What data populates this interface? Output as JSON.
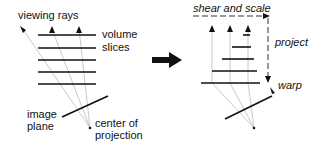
{
  "left_panel": {
    "labels": {
      "viewing_rays": "viewing rays",
      "volume": "volume",
      "slices": "slices",
      "image": "image",
      "plane": "plane",
      "center_of": "center of",
      "projection": "projection"
    }
  },
  "right_panel": {
    "labels": {
      "shear_and_scale": "shear and scale",
      "project": "project",
      "warp": "warp"
    }
  },
  "colors": {
    "line": "#111111",
    "ray": "#bbbbbb"
  }
}
